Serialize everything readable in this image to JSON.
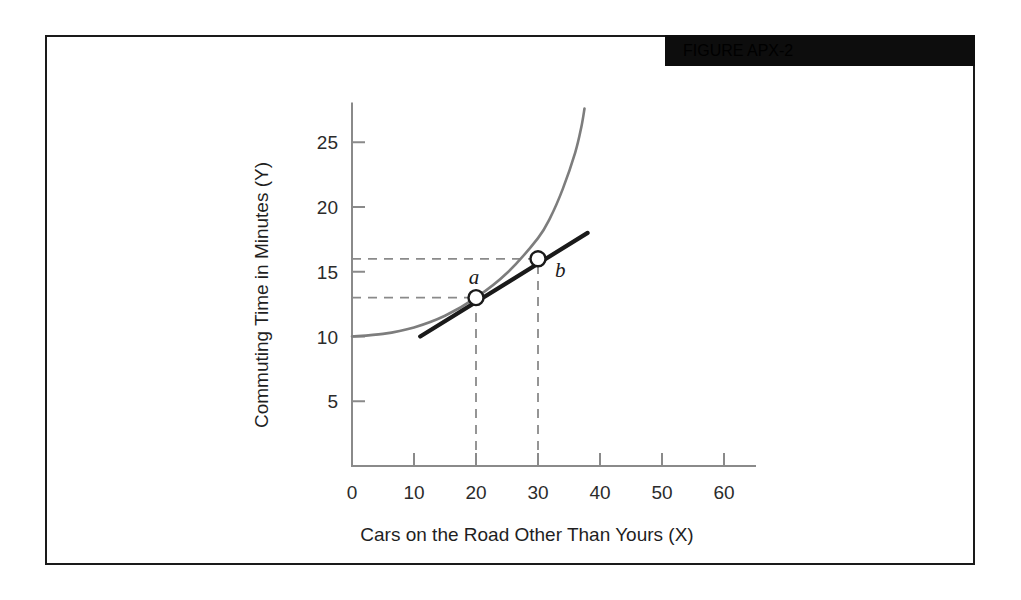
{
  "figure": {
    "banner_label": "FIGURE APX-2"
  },
  "chart_data": {
    "type": "line",
    "title": "",
    "xlabel": "Cars on the Road Other Than Yours (X)",
    "ylabel": "Commuting Time in Minutes (Y)",
    "xlim": [
      0,
      65
    ],
    "ylim": [
      0,
      28
    ],
    "xticks": [
      "0",
      "10",
      "20",
      "30",
      "40",
      "50",
      "60"
    ],
    "xtick_values": [
      0,
      10,
      20,
      30,
      40,
      50,
      60
    ],
    "yticks": [
      "5",
      "10",
      "15",
      "20",
      "25"
    ],
    "ytick_values": [
      5,
      10,
      15,
      20,
      25
    ],
    "grid": false,
    "legend": "none",
    "series": [
      {
        "name": "total-commuting-time-curve",
        "type": "curve",
        "color": "#7d7d7d",
        "x": [
          0,
          5,
          10,
          15,
          20,
          25,
          30,
          32,
          34,
          36,
          37,
          37.5
        ],
        "y": [
          10.0,
          10.2,
          10.7,
          11.6,
          13.0,
          14.9,
          17.6,
          19.2,
          21.4,
          24.2,
          26.2,
          27.6
        ]
      },
      {
        "name": "secant-line-ab",
        "type": "line",
        "color": "#1a1a1a",
        "x": [
          11,
          38
        ],
        "y": [
          10.0,
          18.0
        ]
      }
    ],
    "points": [
      {
        "label": "a",
        "x": 20,
        "y": 13,
        "marker": "open-circle"
      },
      {
        "label": "b",
        "x": 30,
        "y": 16,
        "marker": "open-circle"
      }
    ],
    "guide_lines": [
      {
        "name": "guide-a-horizontal",
        "axis": "y",
        "value": 13,
        "style": "dashed"
      },
      {
        "name": "guide-a-vertical",
        "axis": "x",
        "value": 20,
        "style": "dashed"
      },
      {
        "name": "guide-b-horizontal",
        "axis": "y",
        "value": 16,
        "style": "dashed"
      },
      {
        "name": "guide-b-vertical",
        "axis": "x",
        "value": 30,
        "style": "dashed"
      }
    ],
    "colors": {
      "curve": "#7d7d7d",
      "secant": "#1a1a1a",
      "axis": "#8a8a8a",
      "guide": "#8a8a8a",
      "banner": "#0d0d0d",
      "frame": "#1a1a1a"
    }
  }
}
